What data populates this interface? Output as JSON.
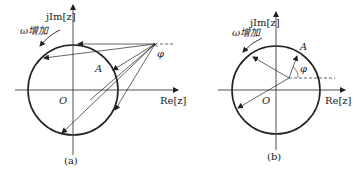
{
  "panels": [
    {
      "id": "a",
      "caption": "(a)",
      "y_axis_label": "jIm[z]",
      "x_axis_label": "Re[z]",
      "origin_label": "O",
      "rotation_label": "ω增加",
      "point_label": "A",
      "angle_label": "φ"
    },
    {
      "id": "b",
      "caption": "(b)",
      "y_axis_label": "jIm[z]",
      "x_axis_label": "Re[z]",
      "origin_label": "O",
      "rotation_label": "ω增加",
      "point_label": "A",
      "angle_label": "φ"
    }
  ],
  "colors": {
    "stroke": "#222222",
    "background": "#ffffff"
  }
}
